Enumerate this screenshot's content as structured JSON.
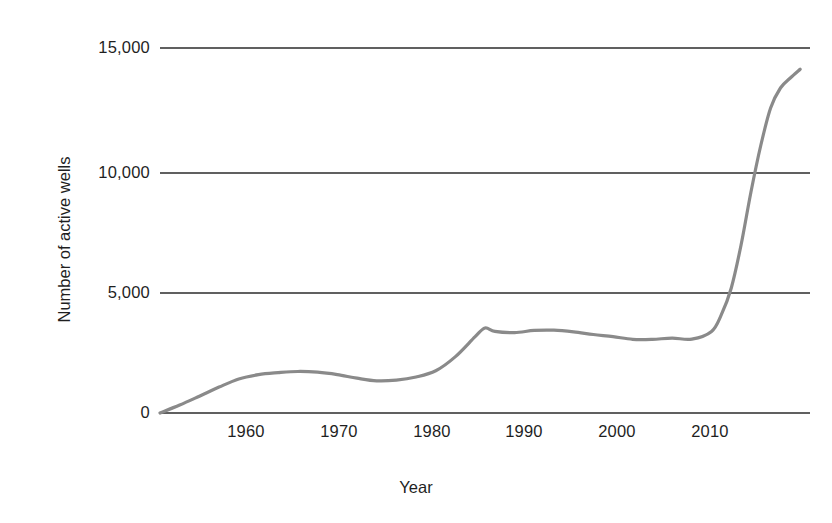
{
  "chart_data": {
    "type": "line",
    "title": "",
    "subtitle": "",
    "xlabel": "Year",
    "ylabel": "Number of active wells",
    "xlim": [
      1952,
      2018
    ],
    "ylim": [
      0,
      15000
    ],
    "grid": true,
    "grid_axis": "y",
    "legend": "none",
    "line_color": "#8a8a8a",
    "axis_color": "#2b2b2b",
    "x_ticks": [
      1960,
      1970,
      1980,
      1990,
      2000,
      2010
    ],
    "x_tick_labels": [
      "1960",
      "1970",
      "1980",
      "1990",
      "2000",
      "2010"
    ],
    "y_ticks": [
      0,
      5000,
      10000,
      15000
    ],
    "y_tick_labels": [
      "0",
      "5,000",
      "10,000",
      "15,000"
    ],
    "series": [
      {
        "name": "Active wells",
        "x": [
          1952,
          1954,
          1956,
          1958,
          1960,
          1962,
          1964,
          1966,
          1968,
          1970,
          1972,
          1974,
          1976,
          1978,
          1980,
          1982,
          1984,
          1985,
          1986,
          1988,
          1990,
          1992,
          1994,
          1996,
          1998,
          2000,
          2002,
          2004,
          2006,
          2008,
          2009,
          2010,
          2011,
          2012,
          2013,
          2014,
          2015,
          2016,
          2017
        ],
        "y": [
          0,
          330,
          700,
          1080,
          1420,
          1600,
          1680,
          1730,
          1700,
          1600,
          1450,
          1340,
          1370,
          1500,
          1760,
          2350,
          3180,
          3540,
          3400,
          3350,
          3440,
          3450,
          3380,
          3270,
          3180,
          3070,
          3070,
          3120,
          3080,
          3400,
          4100,
          5200,
          7000,
          9200,
          11100,
          12600,
          13400,
          13800,
          14150
        ]
      }
    ]
  },
  "axis_titles": {
    "x": "Year",
    "y": "Number of active wells"
  }
}
